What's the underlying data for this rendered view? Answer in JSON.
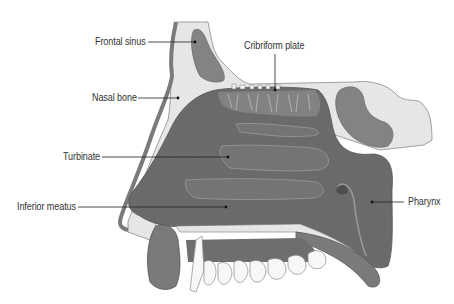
{
  "diagram": {
    "colors": {
      "cavity": "#6b6b6b",
      "cavity_dark": "#5e5e5e",
      "bone": "#e6e6e6",
      "sinus": "#838383",
      "soft_tissue": "#7a7a7a",
      "teeth": "#f7f7f7",
      "leader_line": "#222222",
      "label_text": "#333333"
    },
    "labels": [
      {
        "id": "frontal-sinus",
        "text": "Frontal sinus"
      },
      {
        "id": "cribriform-plate",
        "text": "Cribriform plate"
      },
      {
        "id": "nasal-bone",
        "text": "Nasal bone"
      },
      {
        "id": "turbinate",
        "text": "Turbinate"
      },
      {
        "id": "inferior-meatus",
        "text": "Inferior meatus"
      },
      {
        "id": "pharynx",
        "text": "Pharynx"
      }
    ]
  }
}
